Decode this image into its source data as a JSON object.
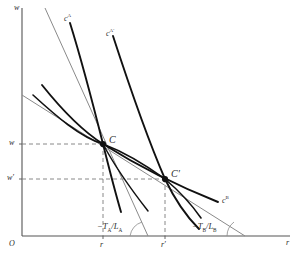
{
  "figure": {
    "kind": "economics-diagram",
    "axes": {
      "y_axis_label": "w",
      "x_axis_label": "r",
      "origin_label": "O"
    },
    "tick_labels": {
      "y": [
        "w",
        "w′"
      ],
      "x": [
        "r",
        "r′"
      ]
    },
    "points": [
      {
        "id": "C",
        "label": "C"
      },
      {
        "id": "Cprime",
        "label": "C′"
      }
    ],
    "curves": [
      {
        "id": "cA",
        "label_base": "c",
        "label_sup": "A",
        "label": "cᴬ"
      },
      {
        "id": "cAprime",
        "label_base": "c",
        "label_sup": "A′",
        "label": "cᴬ′"
      },
      {
        "id": "cB",
        "label_base": "c",
        "label_sup": "B",
        "label": "cᴮ"
      }
    ],
    "slope_annotations": [
      {
        "id": "slopeA",
        "label": "− Tₐ/Lₐ",
        "minus": "−",
        "num": "T",
        "num_sub": "A",
        "den": "L",
        "den_sub": "A"
      },
      {
        "id": "slopeB",
        "label": "− Tʙ/Lʙ",
        "minus": "−",
        "num": "T",
        "num_sub": "B",
        "den": "L",
        "den_sub": "B"
      }
    ],
    "colors": {
      "axis": "#555555",
      "curve_dark": "#1a1a1a",
      "line_gray": "#8a8a8a",
      "dashed": "#7a7a7a",
      "text": "#2b2b2b",
      "background": "#ffffff"
    }
  }
}
